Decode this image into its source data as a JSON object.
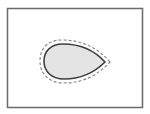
{
  "diagram": {
    "type": "offset-outline",
    "colors": {
      "background": "#ffffff",
      "frame_stroke": "#6a6a6a",
      "shape_fill": "#e4e4e4",
      "shape_stroke": "#3f3f3f",
      "offset_stroke": "#8a8a8a"
    },
    "frame": {
      "x": 7,
      "y": 8,
      "width": 136,
      "height": 100
    },
    "shape": {
      "name": "teardrop",
      "left_x": 44,
      "top_y": 44,
      "bottom_y": 80,
      "tip": [
        105,
        62
      ]
    },
    "offset_outline": {
      "style": "dashed",
      "offset_px": 4
    }
  }
}
